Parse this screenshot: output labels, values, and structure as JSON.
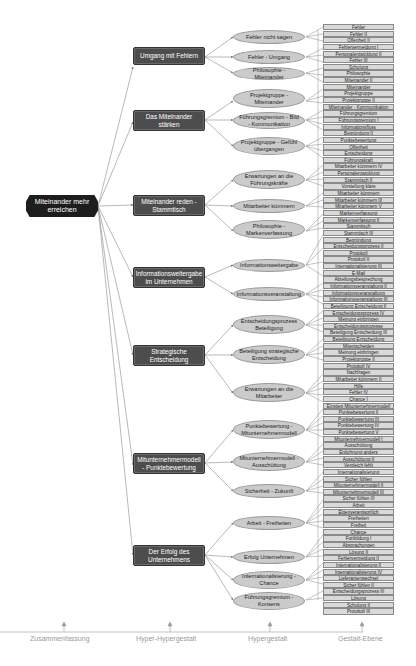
{
  "root": {
    "label": "Miteinander mehr erreichen"
  },
  "hyper_hyper": [
    {
      "label": "Umgang mit Fehlern"
    },
    {
      "label": "Das Miteinander stärken"
    },
    {
      "label": "Miteinander reden - Stammtisch"
    },
    {
      "label": "Informationsweitergabe im Unternehmen"
    },
    {
      "label": "Strategische Entscheidung"
    },
    {
      "label": "Mitunternehmermodell - Punktebewertung"
    },
    {
      "label": "Der Erfolg des Unternehmens"
    }
  ],
  "hyper": [
    {
      "label": "Fehler nicht sagen"
    },
    {
      "label": "Fehler - Umgang"
    },
    {
      "label": "Philosophie - Miteinander"
    },
    {
      "label": "Projektgruppe - Miteinander"
    },
    {
      "label": "Führungsgremium - Bild - Kommunikation"
    },
    {
      "label": "Projektgruppe - Gefühl übergangen"
    },
    {
      "label": "Erwartungen an die Führungskräfte"
    },
    {
      "label": "Mitarbeiter kümmern"
    },
    {
      "label": "Philosophie - Markenverfassung"
    },
    {
      "label": "Informationsweitergabe"
    },
    {
      "label": "Informationsveranstaltung"
    },
    {
      "label": "Entscheidungsprozess Beteiligung"
    },
    {
      "label": "Beteiligung strategische Entscheidung"
    },
    {
      "label": "Erwartungen an die Mitarbeiter"
    },
    {
      "label": "Punktebewertung - Mitunternehmermodell"
    },
    {
      "label": "Mitunternehmermodell - Ausschüttung"
    },
    {
      "label": "Sicherheit - Zukunft"
    },
    {
      "label": "Arbeit - Freiheiten"
    },
    {
      "label": "Erfolg Unternehmen"
    },
    {
      "label": "Internationalisierung - Chance"
    },
    {
      "label": "Führungsgremium - Konsens"
    }
  ],
  "gestalt": [
    "Fehler",
    "Fehler II",
    "Offenheit II",
    "Fehlervermeidung I",
    "Personalentwicklung II",
    "Fehler III",
    "Schulung",
    "Philosophie",
    "Miteinander II",
    "Miteinander",
    "Projektgruppe",
    "Projektgruppe II",
    "Miteinander - Kommunikation",
    "Führungsgremium",
    "Führungsgremium I",
    "Informationsfluss",
    "Begründung II",
    "Punktebewertung",
    "Offenheit",
    "Entscheidung",
    "Führungskraft",
    "Mitarbeiter kümmern IV",
    "Personalentwicklung",
    "Stammtisch II",
    "Vorstellung klare",
    "Mitarbeiter kümmern",
    "Mitarbeiter kümmern III",
    "Mitarbeiter kümmern V",
    "Markenverfassung",
    "Markenverfassung II",
    "Stammtisch",
    "Stammtisch III",
    "Begründung",
    "Entscheidungsprozess II",
    "Protokoll",
    "Protokoll II",
    "Internationalisierung III",
    "E-Mail",
    "Abteilungsbesprechung",
    "Informationsveranstaltung II",
    "Informationsveranstaltung",
    "Informationsveranstaltung III",
    "Beteiligung Entscheidung II",
    "Entscheidungsprozess IV",
    "Meinung einbringen",
    "Entscheidungsprozesse",
    "Beteiligung Entscheidung III",
    "Beteiligung Entscheidung",
    "Mitentscheiden",
    "Meinung einbringen",
    "Projektgruppe II",
    "Protokoll IV",
    "Nachfragen",
    "Mitarbeiter kümmern II",
    "Hilfe",
    "Fehler IV",
    "Chance I",
    "Einstieg Mitunternehmermodell",
    "Punktebewertung II",
    "Punktebewertung III",
    "Punktebewertung IV",
    "Punktebewertung V",
    "Mitunternehmermodell I",
    "Ausschüttung",
    "Entlohnung anders",
    "Ausschüttung II",
    "Vergleich fehlt",
    "Internationalisierung",
    "Sicher fühlen",
    "Mitunternehmermodell II",
    "Mitunternehmermodell III",
    "Sicher fühlen III",
    "Arbeit",
    "Eigenverantwortlich",
    "Freiheiten",
    "Freiheit",
    "Chance",
    "Fortbildung I",
    "Absprachungen",
    "Lösung II",
    "Fehlervermeidung II",
    "Internationalisierung II",
    "Internationalisierung IV",
    "Lieferantenwechsel",
    "Sicher fühlen II",
    "Entscheidungsprozess III",
    "Lösung",
    "Schulung II",
    "Protokoll III"
  ],
  "axis": {
    "labels": [
      "Zusammenfassung",
      "Hyper-Hypergestalt",
      "Hypergestalt",
      "Gestalt-Ebene"
    ]
  },
  "colors": {
    "root": "#1d1d1d",
    "hyper_hyper": "#4d4d4d",
    "hyper": "#cbcbcb",
    "gestalt": "#d9d9d9",
    "lines": "#7a7a7a",
    "axis_text": "#9a9a9a"
  }
}
